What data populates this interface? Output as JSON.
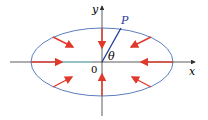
{
  "diagram": {
    "labels": {
      "x_axis": "x",
      "y_axis": "y",
      "point": "P",
      "angle": "θ",
      "origin": "0"
    },
    "colors": {
      "ellipse": "#4a6fb5",
      "arrows": "#e0392b",
      "radius": "#1f3a93",
      "axes": "#333333",
      "highlight": "#7fd6e0"
    }
  }
}
